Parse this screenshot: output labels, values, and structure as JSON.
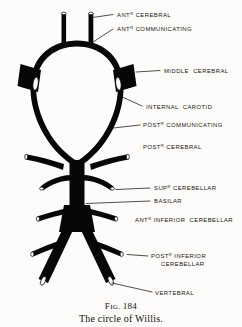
{
  "figure": {
    "caption_number": "Fig. 184",
    "caption_number_prefix": "F",
    "caption_number_smallcaps": "IG.",
    "caption_number_value": "184",
    "caption_title": "The circle of Willis.",
    "background_color": "#fdfcfa",
    "ink_color": "#080707"
  },
  "labels": [
    {
      "id": "ant-cerebral",
      "text": "ANT",
      "sup": "R",
      "rest": " CEREBRAL",
      "line2": ""
    },
    {
      "id": "ant-communicating",
      "text": "ANT",
      "sup": "R",
      "rest": " COMMUNICATING",
      "line2": ""
    },
    {
      "id": "middle-cerebral",
      "text": "",
      "sup": "",
      "rest": "MIDDLE  CEREBRAL",
      "line2": ""
    },
    {
      "id": "internal-carotid",
      "text": "",
      "sup": "",
      "rest": "INTERNAL  CAROTID",
      "line2": ""
    },
    {
      "id": "post-communicating",
      "text": "POST",
      "sup": "R",
      "rest": " COMMUNICATING",
      "line2": ""
    },
    {
      "id": "post-cerebral",
      "text": "POST",
      "sup": "R",
      "rest": " CEREBRAL",
      "line2": ""
    },
    {
      "id": "sup-cerebellar",
      "text": "SUP",
      "sup": "R",
      "rest": " CEREBELLAR",
      "line2": ""
    },
    {
      "id": "basilar",
      "text": "",
      "sup": "",
      "rest": "BASILAR",
      "line2": ""
    },
    {
      "id": "ant-inferior-cerebellar",
      "text": "ANT",
      "sup": "R",
      "rest": " INFERIOR  CEREBELLAR",
      "line2": ""
    },
    {
      "id": "post-inferior-cerebellar",
      "text": "POST",
      "sup": "R",
      "rest": " INFERIOR",
      "line2": "CEREBELLAR"
    },
    {
      "id": "vertebral",
      "text": "",
      "sup": "",
      "rest": "VERTEBRAL",
      "line2": ""
    }
  ],
  "anatomy": {
    "title": "circle-of-willis-diagram",
    "vessels": [
      "anterior-cerebral-left",
      "anterior-cerebral-right",
      "anterior-communicating",
      "internal-carotid-left",
      "internal-carotid-right",
      "middle-cerebral-left",
      "middle-cerebral-right",
      "posterior-communicating-left",
      "posterior-communicating-right",
      "posterior-cerebral-left",
      "posterior-cerebral-right",
      "superior-cerebellar-left",
      "superior-cerebellar-right",
      "basilar",
      "anterior-inferior-cerebellar-left",
      "anterior-inferior-cerebellar-right",
      "posterior-inferior-cerebellar-left",
      "posterior-inferior-cerebellar-right",
      "vertebral-left",
      "vertebral-right"
    ]
  }
}
